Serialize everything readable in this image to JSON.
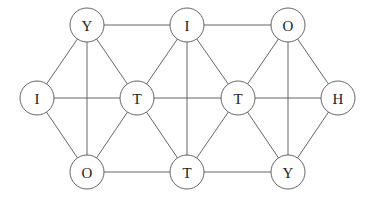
{
  "diagram": {
    "type": "graph",
    "node_radius": 17,
    "colors": {
      "stroke": "#555555",
      "text": "#222222",
      "background": "#ffffff"
    },
    "nodes": [
      {
        "id": "n1",
        "label": "Y",
        "x": 87,
        "y": 25
      },
      {
        "id": "n2",
        "label": "I",
        "x": 187,
        "y": 25
      },
      {
        "id": "n3",
        "label": "O",
        "x": 288,
        "y": 25
      },
      {
        "id": "n4",
        "label": "I",
        "x": 37,
        "y": 98
      },
      {
        "id": "n5",
        "label": "T",
        "x": 137,
        "y": 98
      },
      {
        "id": "n6",
        "label": "T",
        "x": 238,
        "y": 98
      },
      {
        "id": "n7",
        "label": "H",
        "x": 338,
        "y": 98
      },
      {
        "id": "n8",
        "label": "O",
        "x": 87,
        "y": 172
      },
      {
        "id": "n9",
        "label": "T",
        "x": 187,
        "y": 172
      },
      {
        "id": "n10",
        "label": "Y",
        "x": 288,
        "y": 172
      }
    ],
    "edges": [
      [
        "n1",
        "n2"
      ],
      [
        "n2",
        "n3"
      ],
      [
        "n4",
        "n5"
      ],
      [
        "n5",
        "n6"
      ],
      [
        "n6",
        "n7"
      ],
      [
        "n8",
        "n9"
      ],
      [
        "n9",
        "n10"
      ],
      [
        "n1",
        "n8"
      ],
      [
        "n2",
        "n9"
      ],
      [
        "n3",
        "n10"
      ],
      [
        "n1",
        "n4"
      ],
      [
        "n1",
        "n5"
      ],
      [
        "n2",
        "n5"
      ],
      [
        "n2",
        "n6"
      ],
      [
        "n3",
        "n6"
      ],
      [
        "n3",
        "n7"
      ],
      [
        "n4",
        "n8"
      ],
      [
        "n5",
        "n8"
      ],
      [
        "n5",
        "n9"
      ],
      [
        "n6",
        "n9"
      ],
      [
        "n6",
        "n10"
      ],
      [
        "n7",
        "n10"
      ]
    ]
  }
}
